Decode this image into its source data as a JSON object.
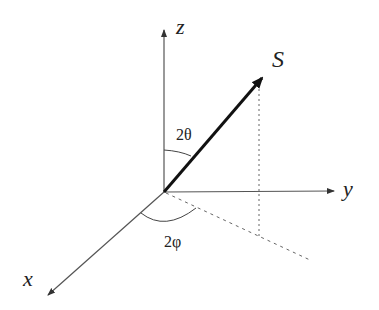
{
  "diagram": {
    "axes": {
      "z_label": "z",
      "y_label": "y",
      "x_label": "x"
    },
    "vector_label": "S",
    "angles": {
      "polar": "2θ",
      "azimuthal": "2φ"
    },
    "colors": {
      "axis": "#444444",
      "vector": "#111111",
      "dashed": "#555555"
    }
  }
}
